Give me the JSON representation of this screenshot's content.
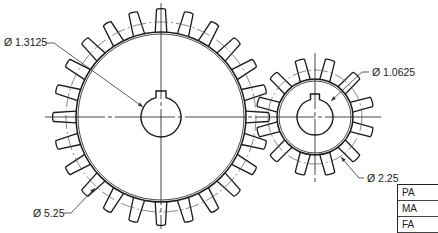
{
  "drawing": {
    "type": "spur-gear-mesh-technical-drawing",
    "background": "#ffffff",
    "line_color": "#1a1a1a",
    "pitch_line_color": "#555555"
  },
  "gears": [
    {
      "name": "large-gear",
      "center": [
        161,
        117
      ],
      "root_radius": 85,
      "pitch_radius": 95,
      "tip_radius": 107,
      "teeth": 24,
      "rotation_offset_deg": 0,
      "bore_radius": 20,
      "keyway": {
        "width": 10,
        "depth": 6
      },
      "bore_diameter_label": "Ø 1.3125",
      "pitch_diameter_label": "Ø 5.25"
    },
    {
      "name": "small-gear",
      "center": [
        315,
        117
      ],
      "root_radius": 38,
      "pitch_radius": 47,
      "tip_radius": 58,
      "teeth": 12,
      "rotation_offset_deg": 15,
      "bore_radius": 18,
      "keyway": {
        "width": 9,
        "depth": 5
      },
      "bore_diameter_label": "Ø 1.0625",
      "pitch_diameter_label": "Ø 2.25"
    }
  ],
  "centerlines": {
    "horizontal": {
      "x1": 45,
      "x2": 381,
      "y": 117
    },
    "large_vertical": {
      "x": 161,
      "y1": 3,
      "y2": 229
    },
    "small_vertical": {
      "x": 315,
      "y1": 53,
      "y2": 184
    }
  },
  "dimensions": [
    {
      "id": "large-bore",
      "text": "Ø 1.3125",
      "label_pos": [
        4,
        37
      ],
      "leader": [
        [
          46,
          43
        ],
        [
          54,
          43
        ],
        [
          143,
          107
        ]
      ]
    },
    {
      "id": "small-bore",
      "text": "Ø 1.0625",
      "label_pos": [
        372,
        67
      ],
      "leader": [
        [
          369,
          72
        ],
        [
          362,
          72
        ],
        [
          331,
          101
        ]
      ]
    },
    {
      "id": "small-pitch",
      "text": "Ø 2.25",
      "label_pos": [
        367,
        173
      ],
      "leader": [
        [
          364,
          178
        ],
        [
          359,
          178
        ],
        [
          341,
          157
        ]
      ]
    },
    {
      "id": "large-pitch",
      "text": "Ø 5.25",
      "label_pos": [
        33,
        208
      ],
      "leader": [
        [
          64,
          213
        ],
        [
          71,
          213
        ],
        [
          95,
          188
        ]
      ]
    }
  ],
  "title_block": {
    "rows": [
      "PA",
      "MA",
      "FA"
    ]
  }
}
